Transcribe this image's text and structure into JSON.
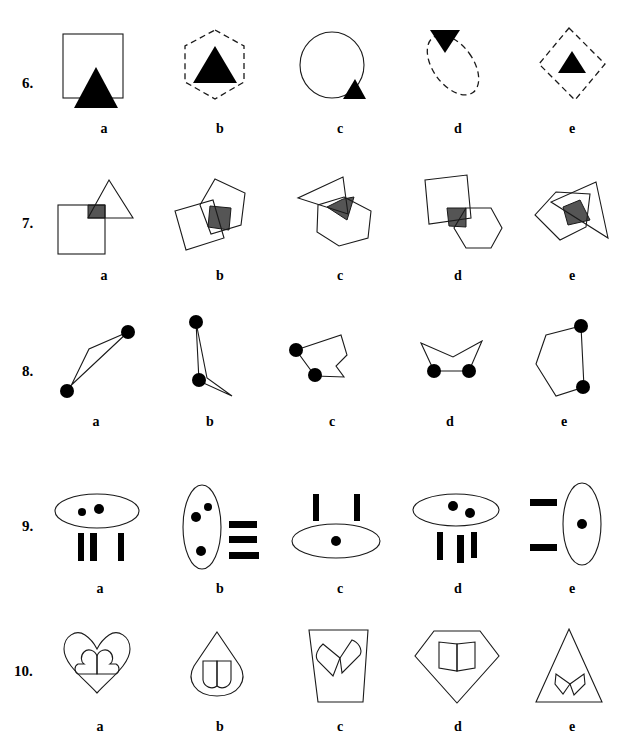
{
  "page": {
    "kind": "figure-classification-worksheet",
    "background_color": "#ffffff",
    "ink_color": "#1a1a1a",
    "fill_color": "#000000",
    "overlap_color": "#555555"
  },
  "option_labels": [
    "a",
    "b",
    "c",
    "d",
    "e"
  ],
  "rows": [
    {
      "number": "6.",
      "options": [
        {
          "label": "a",
          "description": "solid square with large filled triangle at bottom center overlapping the base",
          "outer_shape": "square",
          "outer_style": "solid",
          "inner_shape": "triangle-up",
          "inner_fill": "black",
          "inner_position": "bottom-center-overlapping"
        },
        {
          "label": "b",
          "description": "dashed hexagon containing a large filled triangle",
          "outer_shape": "hexagon",
          "outer_style": "dashed",
          "inner_shape": "triangle-up",
          "inner_fill": "black",
          "inner_position": "center"
        },
        {
          "label": "c",
          "description": "solid circle with small filled triangle at lower right on the boundary",
          "outer_shape": "circle",
          "outer_style": "solid",
          "inner_shape": "triangle-up",
          "inner_fill": "black",
          "inner_position": "bottom-right-on-edge"
        },
        {
          "label": "d",
          "description": "dashed tilted ellipse with small inverted filled triangle at top left on the boundary",
          "outer_shape": "ellipse-tilted",
          "outer_style": "dashed",
          "inner_shape": "triangle-down",
          "inner_fill": "black",
          "inner_position": "top-left-on-edge"
        },
        {
          "label": "e",
          "description": "dashed rotated square containing a small filled triangle",
          "outer_shape": "square-rotated",
          "outer_style": "dashed",
          "inner_shape": "triangle-up",
          "inner_fill": "black",
          "inner_position": "center"
        }
      ]
    },
    {
      "number": "7.",
      "options": [
        {
          "label": "a",
          "description": "square and triangle overlapping, intersection shaded gray",
          "shapes": [
            "square",
            "triangle"
          ],
          "overlap_fill": "gray"
        },
        {
          "label": "b",
          "description": "tilted square and pentagon overlapping, intersection shaded gray",
          "shapes": [
            "square-tilted",
            "pentagon"
          ],
          "overlap_fill": "gray"
        },
        {
          "label": "c",
          "description": "triangle and hexagon overlapping, intersection shaded gray",
          "shapes": [
            "triangle",
            "hexagon"
          ],
          "overlap_fill": "gray"
        },
        {
          "label": "d",
          "description": "tilted square and hexagon overlapping, intersection shaded gray",
          "shapes": [
            "square-tilted",
            "hexagon"
          ],
          "overlap_fill": "gray"
        },
        {
          "label": "e",
          "description": "pentagon and triangle overlapping, intersection shaded gray",
          "shapes": [
            "pentagon",
            "triangle"
          ],
          "overlap_fill": "gray"
        }
      ]
    },
    {
      "number": "8.",
      "options": [
        {
          "label": "a",
          "description": "narrow elongated triangle-like polygon with two filled dots at opposite vertices",
          "dot_count": 2,
          "dot_fill": "black"
        },
        {
          "label": "b",
          "description": "narrow tall polygon with two filled dots at top vertex and lower middle vertex",
          "dot_count": 2,
          "dot_fill": "black"
        },
        {
          "label": "c",
          "description": "irregular polygon with two filled dots on adjacent left vertices",
          "dot_count": 2,
          "dot_fill": "black"
        },
        {
          "label": "d",
          "description": "wide concave chevron polygon with two filled dots on the bottom vertices",
          "dot_count": 2,
          "dot_fill": "black"
        },
        {
          "label": "e",
          "description": "tall pentagon with two filled dots on the right vertices",
          "dot_count": 2,
          "dot_fill": "black"
        }
      ]
    },
    {
      "number": "9.",
      "options": [
        {
          "label": "a",
          "description": "horizontal ellipse containing two dots, three vertical bars below",
          "ellipse_orientation": "horizontal",
          "dots_inside": 2,
          "bars": 3,
          "bar_orientation": "vertical",
          "bar_position": "below"
        },
        {
          "label": "b",
          "description": "vertical ellipse containing three dots, three horizontal bars to the right",
          "ellipse_orientation": "vertical",
          "dots_inside": 3,
          "bars": 3,
          "bar_orientation": "horizontal",
          "bar_position": "right"
        },
        {
          "label": "c",
          "description": "horizontal ellipse containing one dot, two vertical bars above",
          "ellipse_orientation": "horizontal",
          "dots_inside": 1,
          "bars": 2,
          "bar_orientation": "vertical",
          "bar_position": "above"
        },
        {
          "label": "d",
          "description": "horizontal ellipse containing two dots, three vertical bars below",
          "ellipse_orientation": "horizontal",
          "dots_inside": 2,
          "bars": 3,
          "bar_orientation": "vertical",
          "bar_position": "below"
        },
        {
          "label": "e",
          "description": "vertical ellipse containing one dot, two horizontal bars to the left",
          "ellipse_orientation": "vertical",
          "dots_inside": 1,
          "bars": 2,
          "bar_orientation": "horizontal",
          "bar_position": "left"
        }
      ]
    },
    {
      "number": "10.",
      "options": [
        {
          "label": "a",
          "description": "large heart outline containing a small heart shape",
          "outer_shape": "heart",
          "inner_shape": "small-heart"
        },
        {
          "label": "b",
          "description": "teardrop outline containing a small two-lobed shape",
          "outer_shape": "teardrop",
          "inner_shape": "small-two-lobed"
        },
        {
          "label": "c",
          "description": "tapered cup outline containing a rotated two-lobed shape",
          "outer_shape": "tapered-cup",
          "inner_shape": "rotated-two-lobed"
        },
        {
          "label": "d",
          "description": "gem / diamond outline containing a two-lobed shape",
          "outer_shape": "gem",
          "inner_shape": "two-lobed"
        },
        {
          "label": "e",
          "description": "tall triangle outline containing a small rotated two-lobed shape",
          "outer_shape": "triangle-tall",
          "inner_shape": "small-rotated-two-lobed"
        }
      ]
    }
  ]
}
